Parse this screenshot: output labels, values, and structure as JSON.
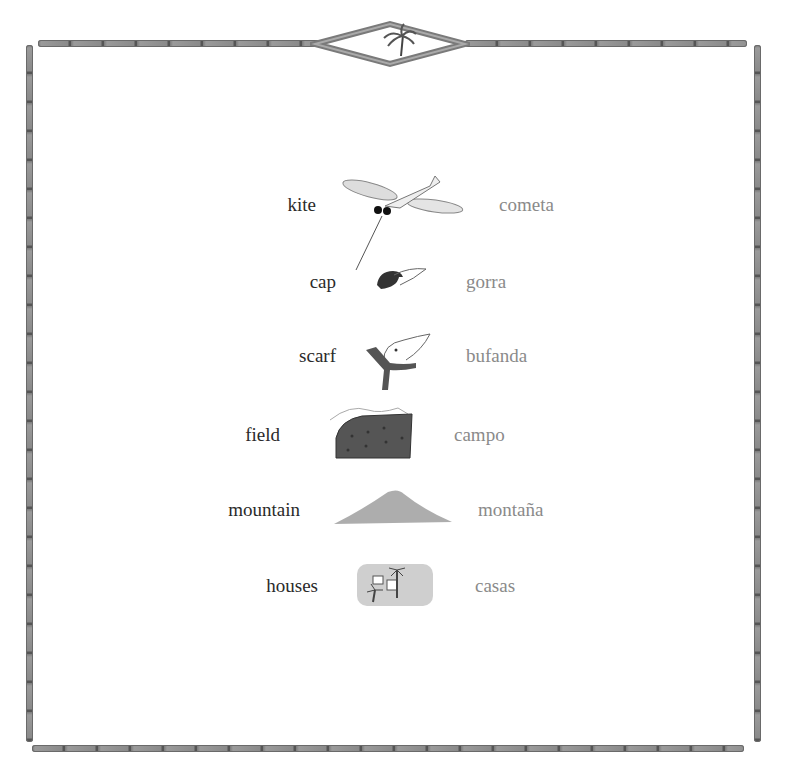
{
  "frame": {
    "style": "bamboo",
    "top_ornament_icon": "palm-tree-icon"
  },
  "vocabulary": [
    {
      "english": "kite",
      "spanish": "cometa",
      "icon": "mosquito-kite-icon"
    },
    {
      "english": "cap",
      "spanish": "gorra",
      "icon": "mouse-in-cap-icon"
    },
    {
      "english": "scarf",
      "spanish": "bufanda",
      "icon": "mouse-with-scarf-icon"
    },
    {
      "english": "field",
      "spanish": "campo",
      "icon": "field-icon"
    },
    {
      "english": "mountain",
      "spanish": "montaña",
      "icon": "mountain-icon"
    },
    {
      "english": "houses",
      "spanish": "casas",
      "icon": "village-houses-icon"
    }
  ],
  "colors": {
    "english_text": "#2a2a2a",
    "spanish_text": "#8a8a8a",
    "frame": "#7a7a7a"
  }
}
